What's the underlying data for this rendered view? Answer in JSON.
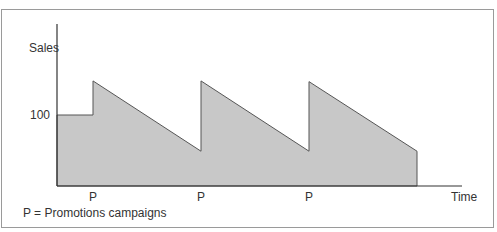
{
  "chart_data": {
    "type": "area",
    "title": "",
    "xlabel": "Time",
    "ylabel": "Sales",
    "y_ticks": [
      {
        "value": 100,
        "label": "100"
      }
    ],
    "x_markers": [
      {
        "x": 1,
        "label": "P"
      },
      {
        "x": 4,
        "label": "P"
      },
      {
        "x": 7,
        "label": "P"
      }
    ],
    "xlim": [
      0,
      11.25
    ],
    "ylim": [
      0,
      160
    ],
    "series": [
      {
        "name": "Sales",
        "points": [
          {
            "x": 0,
            "y": 100
          },
          {
            "x": 1,
            "y": 100
          },
          {
            "x": 1,
            "y": 148
          },
          {
            "x": 4,
            "y": 49
          },
          {
            "x": 4,
            "y": 148
          },
          {
            "x": 7,
            "y": 49
          },
          {
            "x": 7,
            "y": 147
          },
          {
            "x": 10,
            "y": 49
          },
          {
            "x": 10,
            "y": 0
          }
        ]
      }
    ],
    "annotation": "P = Promotions campaigns",
    "grid": false,
    "colors": {
      "fill": "#c8c8c8",
      "stroke": "#555555",
      "axis": "#333333",
      "text": "#333333"
    }
  }
}
